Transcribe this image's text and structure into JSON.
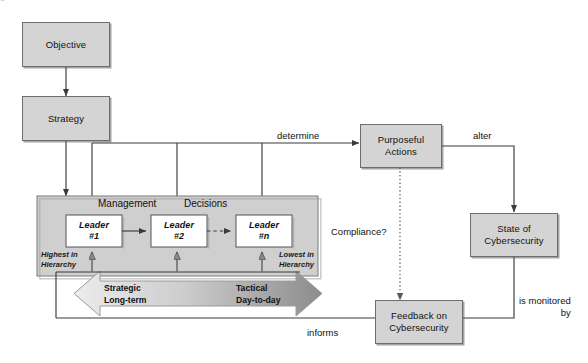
{
  "diagram": {
    "colors": {
      "node_fill": "#d4d4d4",
      "node_stroke": "#6e6e6e",
      "panel_fill": "#cfcfcf",
      "panel_stroke": "#7a7a7a",
      "leader_fill": "#ffffff",
      "line": "#3a3a3a",
      "band_light": "#e6e6e6",
      "band_dark": "#8e8e8e",
      "background": "#ffffff"
    },
    "nodes": {
      "objective": "Objective",
      "strategy": "Strategy",
      "leader1_line1": "Leader",
      "leader1_line2": "#1",
      "leader2_line1": "Leader",
      "leader2_line2": "#2",
      "leadern_line1": "Leader",
      "leadern_line2": "#n",
      "purposeful_actions_line1": "Purposeful",
      "purposeful_actions_line2": "Actions",
      "state_of_cybersecurity_line1": "State of",
      "state_of_cybersecurity_line2": "Cybersecurity",
      "feedback_line1": "Feedback on",
      "feedback_line2": "Cybersecurity"
    },
    "panel_labels": {
      "management": "Management",
      "decisions": "Decisions"
    },
    "hierarchy_labels": {
      "highest_line1": "Highest in",
      "highest_line2": "Hierarchy",
      "lowest_line1": "Lowest in",
      "lowest_line2": "Hierarchy"
    },
    "band_labels": {
      "strategic_line1": "Strategic",
      "strategic_line2": "Long-term",
      "tactical_line1": "Tactical",
      "tactical_line2": "Day-to-day"
    },
    "edge_labels": {
      "determine": "determine",
      "alter": "alter",
      "compliance": "Compliance?",
      "is_monitored_line1": "is monitored",
      "is_monitored_line2": "by",
      "informs": "informs"
    },
    "cropped_caption": "e  ﻿"
  }
}
